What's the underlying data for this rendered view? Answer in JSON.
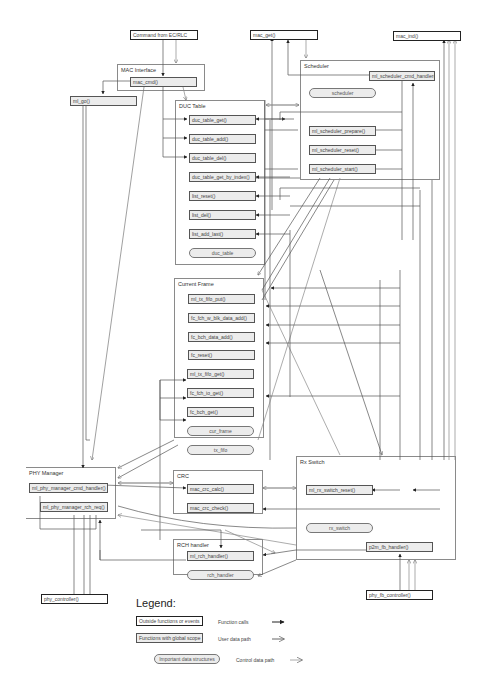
{
  "outside": {
    "command": "Command from EC/RLC",
    "mac_get": "mac_get()",
    "mac_ind": "mac_ind()",
    "ml_go": "ml_go()",
    "phy_controller": "phy_controller()",
    "phy_fb_controller": "phy_fb_controller()"
  },
  "groups": {
    "mac_interface": {
      "title": "MAC Interface",
      "functions": [
        "mac_cmd()"
      ]
    },
    "scheduler": {
      "title": "Scheduler",
      "functions": [
        "ml_scheduler_cmd_handler()",
        "ml_scheduler_prepare()",
        "ml_scheduler_reset()",
        "ml_scheduler_start()"
      ],
      "data": "scheduler"
    },
    "duc_table": {
      "title": "DUC Table",
      "functions": [
        "duc_table_get()",
        "duc_table_add()",
        "duc_table_del()",
        "duc_table_get_by_index()",
        "list_reset()",
        "list_del()",
        "list_add_last()"
      ],
      "data": "duc_table"
    },
    "current_frame": {
      "title": "Current Frame",
      "functions": [
        "ml_tx_fifo_put()",
        "fc_fch_w_blk_data_add()",
        "fc_bch_data_add()",
        "fc_reset()",
        "ml_tx_fifo_get()",
        "fc_fch_io_get()",
        "fc_bch_get()"
      ],
      "data": [
        "cur_frame",
        "tx_fifo"
      ]
    },
    "phy_manager": {
      "title": "PHY Manager",
      "functions": [
        "ml_phy_manager_cmd_handler()",
        "ml_phy_manager_rch_req()"
      ]
    },
    "crc": {
      "title": "CRC",
      "functions": [
        "mac_crc_calc()",
        "mac_crc_check()"
      ]
    },
    "rx_switch": {
      "title": "Rx Switch",
      "functions": [
        "ml_rx_switch_reset()",
        "p2m_fb_handler()"
      ],
      "data": "rx_switch"
    },
    "rch_handler": {
      "title": "RCH handler",
      "functions": [
        "ml_rch_handler()"
      ],
      "data": "rch_handler"
    }
  },
  "legend": {
    "title": "Legend:",
    "box_outside": "Outside functions or events",
    "box_global": "Functions with global scope",
    "box_data": "Important data structures",
    "function_calls": "Function calls",
    "user_data_path": "User data path",
    "control_data_path": "Control data path"
  },
  "colors": {
    "line": "#555555",
    "box_fill": "#ececec",
    "border": "#222222"
  }
}
